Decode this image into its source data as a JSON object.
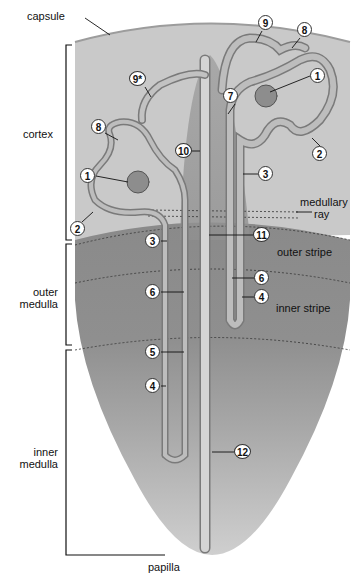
{
  "zones": {
    "capsule": "capsule",
    "cortex": "cortex",
    "medullary_ray": [
      "medullary",
      "ray"
    ],
    "outer_medulla": [
      "outer",
      "medulla"
    ],
    "outer_stripe": "outer stripe",
    "inner_stripe": "inner stripe",
    "inner_medulla": [
      "inner",
      "medulla"
    ],
    "papilla": "papilla"
  },
  "markers": [
    {
      "id": "1",
      "label": "1",
      "x": 318,
      "y": 76
    },
    {
      "id": "1b",
      "label": "1",
      "x": 88,
      "y": 176
    },
    {
      "id": "2",
      "label": "2",
      "x": 320,
      "y": 154
    },
    {
      "id": "2b",
      "label": "2",
      "x": 78,
      "y": 229
    },
    {
      "id": "3",
      "label": "3",
      "x": 266,
      "y": 174
    },
    {
      "id": "3b",
      "label": "3",
      "x": 153,
      "y": 241
    },
    {
      "id": "4",
      "label": "4",
      "x": 262,
      "y": 297
    },
    {
      "id": "4b",
      "label": "4",
      "x": 153,
      "y": 386
    },
    {
      "id": "5",
      "label": "5",
      "x": 153,
      "y": 352
    },
    {
      "id": "6",
      "label": "6",
      "x": 262,
      "y": 278
    },
    {
      "id": "6b",
      "label": "6",
      "x": 153,
      "y": 292
    },
    {
      "id": "7",
      "label": "7",
      "x": 231,
      "y": 96
    },
    {
      "id": "8",
      "label": "8",
      "x": 305,
      "y": 30
    },
    {
      "id": "8b",
      "label": "8",
      "x": 99,
      "y": 127
    },
    {
      "id": "9",
      "label": "9",
      "x": 266,
      "y": 23
    },
    {
      "id": "9s",
      "label": "9*",
      "x": 137,
      "y": 79
    },
    {
      "id": "10",
      "label": "10",
      "x": 183,
      "y": 151
    },
    {
      "id": "11",
      "label": "11",
      "x": 261,
      "y": 235
    },
    {
      "id": "12",
      "label": "12",
      "x": 242,
      "y": 452
    }
  ],
  "colors": {
    "cortex": "#c8c8c8",
    "outer_medulla": "#8e8e8e",
    "inner_medulla": "#a4a4a4",
    "tubule": "#b9b9b9",
    "tubule_edge": "#7a7a7a",
    "ray": "#9a9a9a"
  }
}
